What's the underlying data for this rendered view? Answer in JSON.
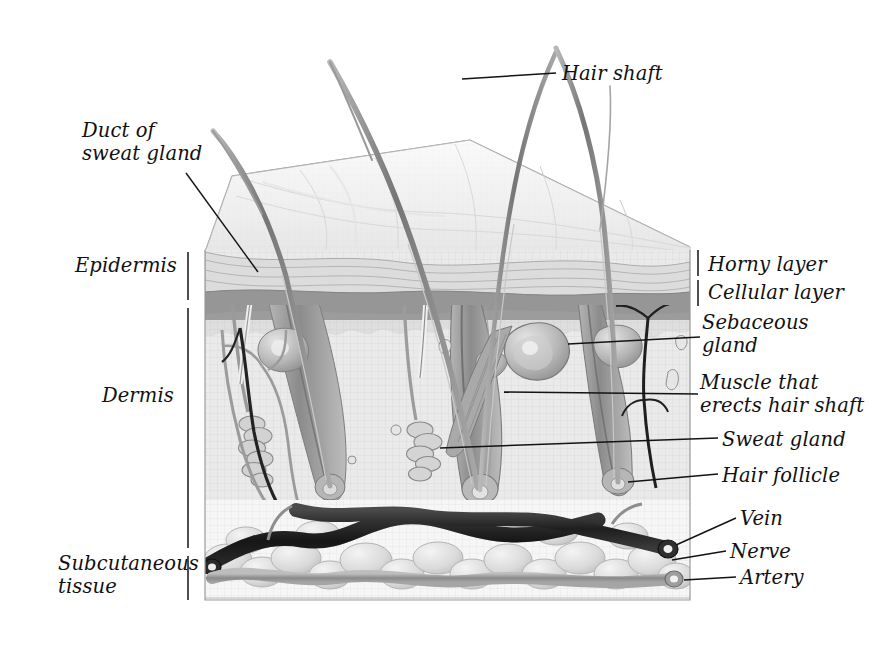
{
  "figure": {
    "type": "anatomical-illustration",
    "style": "pencil/airbrush grayscale medical illustration, 3D block cutaway"
  },
  "labels": {
    "hair_shaft": "Hair shaft",
    "duct_of_sweat_gland": "Duct of\nsweat gland",
    "epidermis": "Epidermis",
    "dermis": "Dermis",
    "subcutaneous_tissue": "Subcutaneous\ntissue",
    "horny_layer": "Horny layer",
    "cellular_layer": "Cellular layer",
    "sebaceous_gland": "Sebaceous\ngland",
    "muscle_that_erects_hair_shaft": "Muscle that\nerects hair shaft",
    "sweat_gland": "Sweat gland",
    "hair_follicle": "Hair follicle",
    "vein": "Vein",
    "nerve": "Nerve",
    "artery": "Artery"
  },
  "structures": [
    {
      "name": "hair-shaft",
      "count": 4,
      "region": "above-skin-surface"
    },
    {
      "name": "horny-layer",
      "region": "epidermis-upper"
    },
    {
      "name": "cellular-layer",
      "region": "epidermis-lower"
    },
    {
      "name": "sebaceous-gland",
      "region": "dermis"
    },
    {
      "name": "arrector-pili-muscle",
      "region": "dermis"
    },
    {
      "name": "sweat-gland",
      "count": 2,
      "region": "dermis"
    },
    {
      "name": "sweat-duct",
      "count": 2,
      "region": "epidermis-dermis"
    },
    {
      "name": "hair-follicle",
      "count": 3,
      "region": "dermis"
    },
    {
      "name": "vein",
      "region": "subcutaneous"
    },
    {
      "name": "artery",
      "region": "subcutaneous"
    },
    {
      "name": "nerve",
      "region": "dermis-subcutaneous"
    },
    {
      "name": "fat-lobules",
      "region": "subcutaneous"
    }
  ],
  "colors": {
    "background": "#ffffff",
    "ink": "#111111",
    "surface_light": "#f2f2f2",
    "horny_layer": "#d8d8d8",
    "cellular_layer": "#9a9a9a",
    "dermis": "#e8e8e8",
    "dermis_hatch": "#cfcfcf",
    "follicle": "#9d9d9d",
    "vein_dark": "#2b2b2b",
    "artery_mid": "#8d8d8d",
    "nerve_dark": "#1f1f1f",
    "fat_lobule": "#dcdcdc",
    "leader_line": "#1a1a1a"
  },
  "brackets": {
    "epidermis": {
      "side": "left"
    },
    "dermis": {
      "side": "left"
    },
    "subcutaneous": {
      "side": "left"
    },
    "horny_layer": {
      "side": "right"
    },
    "cellular_layer": {
      "side": "right"
    }
  }
}
